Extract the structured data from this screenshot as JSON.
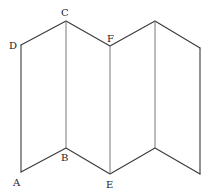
{
  "diagram": {
    "vertices": {
      "D": {
        "x": 21,
        "y": 45,
        "label": "D"
      },
      "C": {
        "x": 66,
        "y": 21,
        "label": "C"
      },
      "F": {
        "x": 110,
        "y": 46,
        "label": "F"
      },
      "G": {
        "x": 155,
        "y": 21,
        "label": ""
      },
      "H": {
        "x": 200,
        "y": 48,
        "label": ""
      },
      "A": {
        "x": 21,
        "y": 172,
        "label": "A"
      },
      "B": {
        "x": 66,
        "y": 148,
        "label": "B"
      },
      "E": {
        "x": 110,
        "y": 174,
        "label": "E"
      },
      "I": {
        "x": 155,
        "y": 148,
        "label": ""
      },
      "J": {
        "x": 200,
        "y": 174,
        "label": ""
      }
    },
    "labels": [
      {
        "id": "A",
        "text": "A",
        "x": 13,
        "y": 186
      },
      {
        "id": "B",
        "text": "B",
        "x": 61,
        "y": 161
      },
      {
        "id": "C",
        "text": "C",
        "x": 61,
        "y": 16
      },
      {
        "id": "D",
        "text": "D",
        "x": 9,
        "y": 49
      },
      {
        "id": "E",
        "text": "E",
        "x": 106,
        "y": 188
      },
      {
        "id": "F",
        "text": "F",
        "x": 107,
        "y": 42
      }
    ],
    "colors": {
      "line": "#3a3a3a",
      "fold": "#6a6a6a",
      "text": "#222222",
      "background": "#ffffff"
    }
  }
}
